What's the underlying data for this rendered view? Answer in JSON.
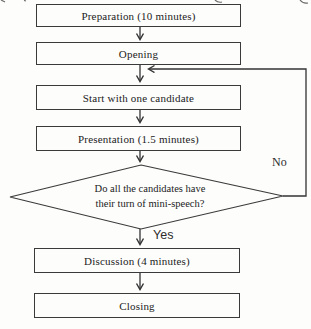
{
  "figure": {
    "type": "flowchart",
    "nodes": [
      {
        "id": "preparation",
        "shape": "rect",
        "label": "Preparation (10 minutes)"
      },
      {
        "id": "opening",
        "shape": "rect",
        "label": "Opening"
      },
      {
        "id": "start",
        "shape": "rect",
        "label": "Start with one candidate"
      },
      {
        "id": "presentation",
        "shape": "rect",
        "label": "Presentation (1.5 minutes)"
      },
      {
        "id": "decision",
        "shape": "diamond",
        "label": "Do all the candidates have their turn of mini-speech?",
        "line1": "Do all the candidates have",
        "line2": "their turn of mini-speech?"
      },
      {
        "id": "discussion",
        "shape": "rect",
        "label": "Discussion (4 minutes)"
      },
      {
        "id": "closing",
        "shape": "rect",
        "label": "Closing"
      }
    ],
    "edges": {
      "yes_label": "Yes",
      "no_label": "No",
      "no_path_description": "From decision right vertex, up the right margin, back into the arrow above 'Start with one candidate'"
    },
    "colors": {
      "line": "#333333",
      "box_border": "#3a3a3a",
      "background": "#fdfdfc",
      "text": "#222222"
    }
  }
}
